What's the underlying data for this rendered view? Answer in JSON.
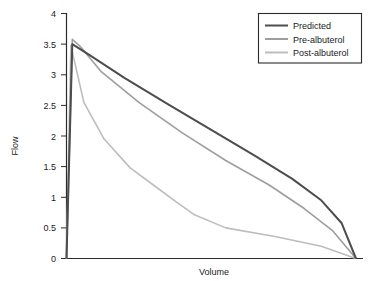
{
  "chart_data": {
    "type": "line",
    "title": "",
    "xlabel": "Volume",
    "ylabel": "Flow",
    "ylim": [
      0,
      4
    ],
    "xlim": [
      0,
      1
    ],
    "grid": false,
    "legend_position": "top-right",
    "yticks": [
      "0",
      "0.5",
      "1",
      "1.5",
      "2",
      "2.5",
      "3",
      "3.5",
      "4"
    ],
    "ytick_values": [
      0,
      0.5,
      1,
      1.5,
      2,
      2.5,
      3,
      3.5,
      4
    ],
    "xticks": [],
    "xtick_labels": [],
    "series": [
      {
        "name": "Predicted",
        "color": "#4d4d4d",
        "width": 2.0,
        "x": [
          0.0,
          0.02,
          0.08,
          0.2,
          0.35,
          0.5,
          0.65,
          0.78,
          0.88,
          0.95,
          1.0
        ],
        "values": [
          0.0,
          3.5,
          3.32,
          2.95,
          2.52,
          2.1,
          1.68,
          1.3,
          0.95,
          0.58,
          0.0
        ]
      },
      {
        "name": "Pre-albuterol",
        "color": "#9e9e9e",
        "width": 1.6,
        "x": [
          0.0,
          0.02,
          0.05,
          0.12,
          0.25,
          0.4,
          0.55,
          0.7,
          0.82,
          0.92,
          1.0
        ],
        "values": [
          0.0,
          3.58,
          3.45,
          3.05,
          2.55,
          2.05,
          1.6,
          1.2,
          0.82,
          0.45,
          0.0
        ]
      },
      {
        "name": "Post-albuterol",
        "color": "#bdbdbd",
        "width": 1.6,
        "x": [
          0.0,
          0.015,
          0.06,
          0.13,
          0.22,
          0.3,
          0.38,
          0.44,
          0.55,
          0.72,
          0.88,
          1.0
        ],
        "values": [
          0.0,
          3.48,
          2.55,
          1.95,
          1.48,
          1.2,
          0.92,
          0.72,
          0.5,
          0.36,
          0.2,
          0.0
        ]
      }
    ]
  },
  "legend": {
    "entries": [
      {
        "label": "Predicted"
      },
      {
        "label": "Pre-albuterol"
      },
      {
        "label": "Post-albuterol"
      }
    ]
  },
  "axes": {
    "y_title": "Flow",
    "x_title": "Volume",
    "ytick_labels": [
      "4",
      "3.5",
      "3",
      "2.5",
      "2",
      "1.5",
      "1",
      "0.5",
      "0"
    ]
  }
}
